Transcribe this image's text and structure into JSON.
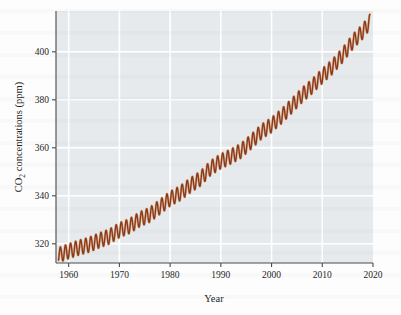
{
  "figure": {
    "background_color": "#fdfdfd",
    "plot_background_color": "#e7eaec",
    "gridline_color": "#ffffff",
    "axis_color": "#4a4a4a",
    "line_color": "#8e3a17"
  },
  "axis": {
    "y_label_main": "CO",
    "y_label_sub": "2",
    "y_label_rest": " concentrations (ppm)",
    "y_label_full": "CO2 concentrations (ppm)",
    "x_label": "Year",
    "y_ticks": [
      320,
      340,
      360,
      380,
      400
    ],
    "x_ticks": [
      1960,
      1970,
      1980,
      1990,
      2000,
      2010,
      2020
    ],
    "xlim": [
      1957.5,
      2020.0
    ],
    "ylim": [
      312.0,
      417.0
    ],
    "grid": true,
    "legend": "none"
  },
  "chart_data": {
    "type": "line",
    "title": "",
    "subtitle": "",
    "xlabel": "Year",
    "ylabel": "CO2 concentrations (ppm)",
    "xlim": [
      1957.5,
      2020.0
    ],
    "ylim": [
      312.0,
      417.0
    ],
    "x_ticks": [
      1960,
      1970,
      1980,
      1990,
      2000,
      2010,
      2020
    ],
    "y_ticks": [
      320,
      340,
      360,
      380,
      400
    ],
    "grid": true,
    "legend_position": "none",
    "series": [
      {
        "name": "Mauna Loa atmospheric CO2 (monthly mean)",
        "color": "#8e3a17",
        "line_width": 1.4,
        "description": "Keeling Curve: accelerating rise with annual sawtooth seasonal cycle, amplitude about 6 ppm peak-to-peak.",
        "seasonal_amplitude_ppm": 3.1,
        "seasonal_peak_month": "May",
        "seasonal_min_month": "September",
        "trend_model": {
          "form": "quadratic",
          "reference_year": 1958,
          "c0_ppm": 315.3,
          "c1_ppm_per_year": 0.72,
          "c2_ppm_per_year2": 0.0128
        },
        "annual_trend_points": [
          {
            "year": 1958,
            "ppm": 315.3
          },
          {
            "year": 1960,
            "ppm": 316.9
          },
          {
            "year": 1962,
            "ppm": 318.4
          },
          {
            "year": 1964,
            "ppm": 319.6
          },
          {
            "year": 1966,
            "ppm": 321.4
          },
          {
            "year": 1968,
            "ppm": 323.0
          },
          {
            "year": 1970,
            "ppm": 325.7
          },
          {
            "year": 1972,
            "ppm": 327.4
          },
          {
            "year": 1974,
            "ppm": 330.2
          },
          {
            "year": 1976,
            "ppm": 332.1
          },
          {
            "year": 1978,
            "ppm": 335.4
          },
          {
            "year": 1980,
            "ppm": 338.8
          },
          {
            "year": 1982,
            "ppm": 341.1
          },
          {
            "year": 1984,
            "ppm": 344.4
          },
          {
            "year": 1986,
            "ppm": 347.2
          },
          {
            "year": 1988,
            "ppm": 351.6
          },
          {
            "year": 1990,
            "ppm": 354.4
          },
          {
            "year": 1992,
            "ppm": 356.4
          },
          {
            "year": 1994,
            "ppm": 358.8
          },
          {
            "year": 1996,
            "ppm": 362.6
          },
          {
            "year": 1998,
            "ppm": 366.7
          },
          {
            "year": 2000,
            "ppm": 369.5
          },
          {
            "year": 2002,
            "ppm": 373.2
          },
          {
            "year": 2004,
            "ppm": 377.5
          },
          {
            "year": 2006,
            "ppm": 381.9
          },
          {
            "year": 2008,
            "ppm": 385.6
          },
          {
            "year": 2010,
            "ppm": 389.9
          },
          {
            "year": 2012,
            "ppm": 393.8
          },
          {
            "year": 2014,
            "ppm": 398.6
          },
          {
            "year": 2016,
            "ppm": 404.2
          },
          {
            "year": 2018,
            "ppm": 408.5
          },
          {
            "year": 2019,
            "ppm": 411.4
          }
        ],
        "start": {
          "year": 1958,
          "ppm": 315.3
        },
        "end": {
          "year": 2019.4,
          "ppm": 414.5
        }
      }
    ]
  }
}
